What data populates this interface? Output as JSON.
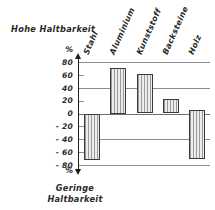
{
  "chart_data": {
    "type": "bar",
    "title": "",
    "categories": [
      "Stahl",
      "Aluminium",
      "Kunststoff",
      "Backsteine",
      "Holz"
    ],
    "values": [
      -72,
      70,
      62,
      22,
      -70
    ],
    "bar_bases": [
      0,
      0,
      0,
      0,
      5
    ],
    "xlabel": "",
    "ylabel": "%",
    "ylim": [
      -80,
      80
    ],
    "yticks": [
      80,
      60,
      40,
      20,
      0,
      -20,
      -40,
      -60,
      -80
    ],
    "ytick_labels": [
      "80",
      "60",
      "40",
      "20",
      "0",
      "- 20",
      "- 40",
      "- 60",
      "- 80"
    ],
    "major_gridlines": [
      80,
      40,
      0,
      -40,
      -80
    ],
    "minor_ticks": [
      60,
      20,
      -20,
      -60
    ],
    "grid": true,
    "legend": "none",
    "axis_unit_top": "%",
    "axis_unit_bottom": "%",
    "annotations": {
      "top_caption": "Hohe Haltbarkeit",
      "bottom_caption_line1": "Geringe",
      "bottom_caption_line2": "Haltbarkeit"
    },
    "colors": {
      "bar_fill": "#ececec",
      "bar_hatch": "#9a9a9a",
      "bar_stroke": "#3b3b3b",
      "gridline": "#8d8d8d",
      "axis": "#1d1d1d",
      "text": "#2a2a2a",
      "background": "#ffffff"
    }
  }
}
